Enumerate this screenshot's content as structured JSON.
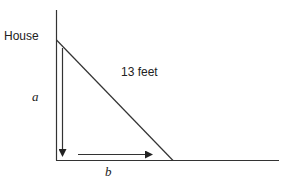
{
  "diagram": {
    "labels": {
      "house": "House",
      "hypotenuse": "13 feet",
      "side_a": "a",
      "side_b": "b"
    },
    "colors": {
      "line": "#222222",
      "background": "#ffffff"
    }
  }
}
